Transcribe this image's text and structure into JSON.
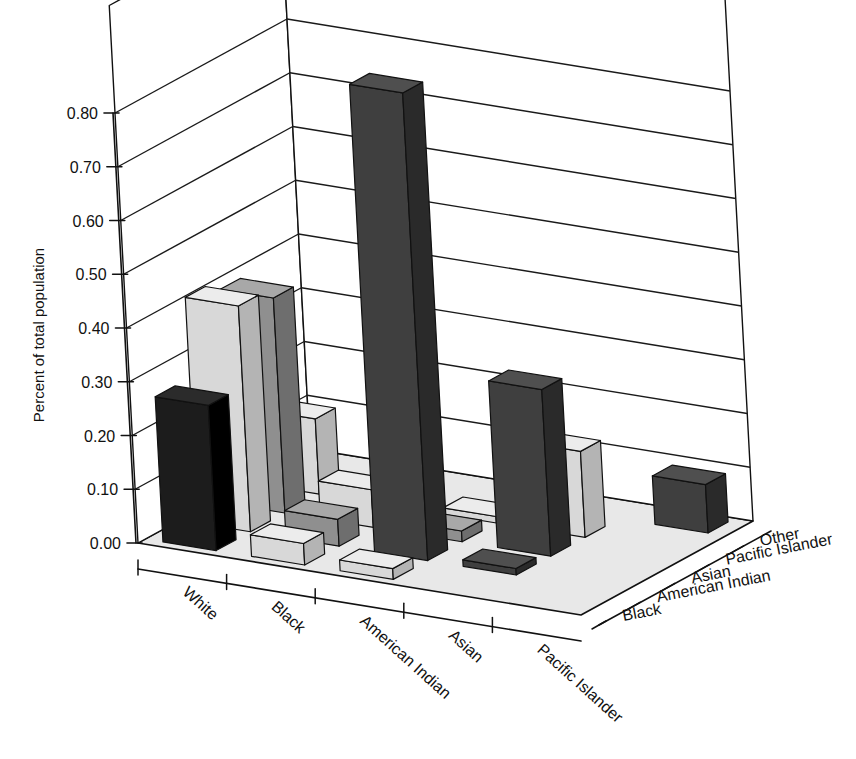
{
  "chart_data": {
    "type": "bar",
    "title": "",
    "subtitle": "",
    "xlabel": "",
    "ylabel": "Percent of total population",
    "zlabel": "",
    "ylim": [
      0.0,
      0.8
    ],
    "ytick_step": 0.1,
    "grid": true,
    "legend": "none",
    "projection": "3d",
    "categories": [
      "White",
      "Black",
      "American Indian",
      "Asian",
      "Pacific Islander"
    ],
    "depth_categories": [
      "Black",
      "American Indian",
      "Asian",
      "Pacific Islander",
      "Other"
    ],
    "ytick_labels": [
      "0.00",
      "0.10",
      "0.20",
      "0.30",
      "0.40",
      "0.50",
      "0.60",
      "0.70",
      "0.80"
    ],
    "ytick_values": [
      0.0,
      0.1,
      0.2,
      0.3,
      0.4,
      0.5,
      0.6,
      0.7,
      0.8
    ],
    "series": [
      {
        "name": "Black",
        "values": [
          0.27,
          0.04,
          0.02,
          0.0,
          0.0
        ]
      },
      {
        "name": "American Indian",
        "values": [
          0.42,
          0.05,
          0.87,
          0.01,
          0.0
        ]
      },
      {
        "name": "Asian",
        "values": [
          0.4,
          0.07,
          0.02,
          0.31,
          0.0
        ]
      },
      {
        "name": "Pacific Islander",
        "values": [
          0.14,
          0.02,
          0.0,
          0.16,
          0.09
        ]
      },
      {
        "name": "Other",
        "values": [
          0.0,
          0.0,
          0.0,
          0.0,
          0.21
        ]
      }
    ],
    "cells": [
      {
        "x": "White",
        "z": "Black",
        "value": 0.27,
        "shade": "black"
      },
      {
        "x": "White",
        "z": "American Indian",
        "value": 0.42,
        "shade": "light"
      },
      {
        "x": "White",
        "z": "Asian",
        "value": 0.4,
        "shade": "medium"
      },
      {
        "x": "White",
        "z": "Pacific Islander",
        "value": 0.14,
        "shade": "light"
      },
      {
        "x": "White",
        "z": "Other",
        "value": 0.0,
        "shade": "none"
      },
      {
        "x": "Black",
        "z": "Black",
        "value": 0.04,
        "shade": "light"
      },
      {
        "x": "Black",
        "z": "American Indian",
        "value": 0.05,
        "shade": "medium"
      },
      {
        "x": "Black",
        "z": "Asian",
        "value": 0.07,
        "shade": "light"
      },
      {
        "x": "Black",
        "z": "Pacific Islander",
        "value": 0.02,
        "shade": "medium"
      },
      {
        "x": "Black",
        "z": "Other",
        "value": 0.0,
        "shade": "none"
      },
      {
        "x": "American Indian",
        "z": "Black",
        "value": 0.02,
        "shade": "light"
      },
      {
        "x": "American Indian",
        "z": "American Indian",
        "value": 0.87,
        "shade": "dark"
      },
      {
        "x": "American Indian",
        "z": "Asian",
        "value": 0.02,
        "shade": "medium"
      },
      {
        "x": "American Indian",
        "z": "Pacific Islander",
        "value": 0.0,
        "shade": "flat"
      },
      {
        "x": "American Indian",
        "z": "Other",
        "value": 0.0,
        "shade": "none"
      },
      {
        "x": "Asian",
        "z": "Black",
        "value": 0.0,
        "shade": "none"
      },
      {
        "x": "Asian",
        "z": "American Indian",
        "value": 0.01,
        "shade": "dark"
      },
      {
        "x": "Asian",
        "z": "Asian",
        "value": 0.31,
        "shade": "dark"
      },
      {
        "x": "Asian",
        "z": "Pacific Islander",
        "value": 0.16,
        "shade": "light"
      },
      {
        "x": "Asian",
        "z": "Other",
        "value": 0.0,
        "shade": "none"
      },
      {
        "x": "Pacific Islander",
        "z": "Black",
        "value": 0.0,
        "shade": "none"
      },
      {
        "x": "Pacific Islander",
        "z": "American Indian",
        "value": 0.0,
        "shade": "none"
      },
      {
        "x": "Pacific Islander",
        "z": "Asian",
        "value": 0.0,
        "shade": "none"
      },
      {
        "x": "Pacific Islander",
        "z": "Pacific Islander",
        "value": 0.0,
        "shade": "none"
      },
      {
        "x": "Pacific Islander",
        "z": "Other",
        "value": 0.09,
        "shade": "dark"
      }
    ],
    "colors": {
      "floor": "#e8e8e8",
      "wall": "#ffffff",
      "grid_line": "#1a1a1a",
      "axis_line": "#111111",
      "bar_black_front": "#1c1c1c",
      "bar_black_top": "#2b2b2b",
      "bar_black_side": "#000000",
      "bar_dark_front": "#3f3f3f",
      "bar_dark_top": "#4f4f4f",
      "bar_dark_side": "#2a2a2a",
      "bar_medium_front": "#8f8f8f",
      "bar_medium_top": "#a8a8a8",
      "bar_medium_side": "#6e6e6e",
      "bar_light_front": "#d8d8d8",
      "bar_light_top": "#ececec",
      "bar_light_side": "#b4b4b4"
    }
  }
}
